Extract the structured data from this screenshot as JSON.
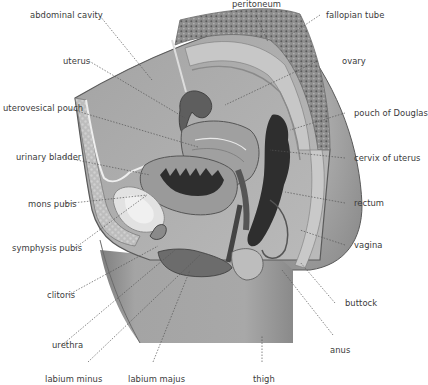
{
  "figure": {
    "colors": {
      "background": "#ffffff",
      "body_fill": "#a9a9a9",
      "abdomen_fill": "#b4b4b4",
      "skin_outline": "#5a5a5a",
      "fat_texture": "#c4c4c4",
      "bowel_texture": "#7c7c7c",
      "dark_organ": "#2e2e2e",
      "mid_organ": "#8a8a8a",
      "light_organ": "#d8d8d8",
      "label_text": "#3a3a3a",
      "leader_line": "#555555"
    }
  },
  "labels": {
    "left": [
      {
        "id": "abdominal-cavity",
        "text": "abdominal cavity"
      },
      {
        "id": "uterus",
        "text": "uterus"
      },
      {
        "id": "uterovesical-pouch",
        "text": "uterovesical pouch"
      },
      {
        "id": "urinary-bladder",
        "text": "urinary bladder"
      },
      {
        "id": "mons-pubis",
        "text": "mons pubis"
      },
      {
        "id": "symphysis-pubis",
        "text": "symphysis pubis"
      },
      {
        "id": "clitoris",
        "text": "clitoris"
      },
      {
        "id": "urethra",
        "text": "urethra"
      }
    ],
    "top": [
      {
        "id": "peritoneum",
        "text": "peritoneum"
      }
    ],
    "right": [
      {
        "id": "fallopian-tube",
        "text": "fallopian tube"
      },
      {
        "id": "ovary",
        "text": "ovary"
      },
      {
        "id": "pouch-of-douglas",
        "text": "pouch of Douglas"
      },
      {
        "id": "cervix-of-uterus",
        "text": "cervix of uterus"
      },
      {
        "id": "rectum",
        "text": "rectum"
      },
      {
        "id": "vagina",
        "text": "vagina"
      },
      {
        "id": "buttock",
        "text": "buttock"
      },
      {
        "id": "anus",
        "text": "anus"
      }
    ],
    "bottom": [
      {
        "id": "labium-minus",
        "text": "labium minus"
      },
      {
        "id": "labium-majus",
        "text": "labium majus"
      },
      {
        "id": "thigh",
        "text": "thigh"
      }
    ]
  }
}
